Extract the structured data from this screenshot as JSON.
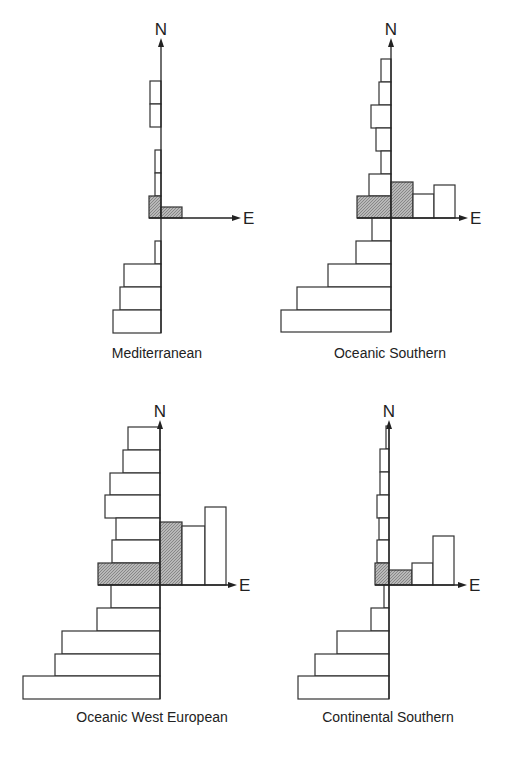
{
  "figure": {
    "axis_labels": {
      "north": "N",
      "east": "E"
    },
    "colors": {
      "line": "#333333",
      "hatch": "#9a9a9a",
      "background": "#ffffff"
    },
    "panels": [
      {
        "id": "mediterranean",
        "caption": "Mediterranean",
        "origin": {
          "x": 161,
          "y": 218
        },
        "n_axis_top": 38,
        "e_axis_right": 232,
        "caption_pos": {
          "x": 157,
          "y": 358
        },
        "west_bars": [
          {
            "y": 81,
            "h": 23,
            "x": 150,
            "hatched": false
          },
          {
            "y": 104,
            "h": 23,
            "x": 150,
            "hatched": false
          },
          {
            "y": 150,
            "h": 23,
            "x": 155,
            "hatched": false
          },
          {
            "y": 173,
            "h": 23,
            "x": 155,
            "hatched": false
          },
          {
            "y": 196,
            "h": 22,
            "x": 149,
            "hatched": true
          },
          {
            "y": 241,
            "h": 23,
            "x": 155,
            "hatched": false
          },
          {
            "y": 264,
            "h": 23,
            "x": 124,
            "hatched": false
          },
          {
            "y": 287,
            "h": 23,
            "x": 120,
            "hatched": false
          },
          {
            "y": 310,
            "h": 23,
            "x": 113,
            "hatched": false
          }
        ],
        "east_bars": [
          {
            "x": 161,
            "w": 21,
            "y": 207,
            "hatched": true
          }
        ]
      },
      {
        "id": "oceanic-southern",
        "caption": "Oceanic Southern",
        "origin": {
          "x": 391,
          "y": 218
        },
        "n_axis_top": 38,
        "e_axis_right": 459,
        "caption_pos": {
          "x": 390,
          "y": 358
        },
        "west_bars": [
          {
            "y": 59,
            "h": 23,
            "x": 381,
            "hatched": false
          },
          {
            "y": 82,
            "h": 23,
            "x": 379,
            "hatched": false
          },
          {
            "y": 105,
            "h": 23,
            "x": 371,
            "hatched": false
          },
          {
            "y": 128,
            "h": 23,
            "x": 376,
            "hatched": false
          },
          {
            "y": 151,
            "h": 23,
            "x": 381,
            "hatched": false
          },
          {
            "y": 174,
            "h": 22,
            "x": 369,
            "hatched": false
          },
          {
            "y": 196,
            "h": 22,
            "x": 357,
            "hatched": true
          },
          {
            "y": 218,
            "h": 23,
            "x": 372,
            "hatched": false
          },
          {
            "y": 241,
            "h": 23,
            "x": 356,
            "hatched": false
          },
          {
            "y": 264,
            "h": 23,
            "x": 328,
            "hatched": false
          },
          {
            "y": 287,
            "h": 23,
            "x": 297,
            "hatched": false
          },
          {
            "y": 310,
            "h": 22,
            "x": 281,
            "hatched": false
          }
        ],
        "east_bars": [
          {
            "x": 391,
            "w": 22,
            "y": 182,
            "hatched": true
          },
          {
            "x": 413,
            "w": 21,
            "y": 194,
            "hatched": false
          },
          {
            "x": 434,
            "w": 21,
            "y": 185,
            "hatched": false
          }
        ]
      },
      {
        "id": "oceanic-west-european",
        "caption": "Oceanic West European",
        "origin": {
          "x": 160,
          "y": 585
        },
        "n_axis_top": 420,
        "e_axis_right": 228,
        "caption_pos": {
          "x": 152,
          "y": 722
        },
        "west_bars": [
          {
            "y": 427,
            "h": 23,
            "x": 128,
            "hatched": false
          },
          {
            "y": 450,
            "h": 23,
            "x": 123,
            "hatched": false
          },
          {
            "y": 473,
            "h": 22,
            "x": 110,
            "hatched": false
          },
          {
            "y": 495,
            "h": 23,
            "x": 105,
            "hatched": false
          },
          {
            "y": 518,
            "h": 22,
            "x": 116,
            "hatched": false
          },
          {
            "y": 540,
            "h": 23,
            "x": 112,
            "hatched": false
          },
          {
            "y": 563,
            "h": 22,
            "x": 98,
            "hatched": true
          },
          {
            "y": 585,
            "h": 23,
            "x": 111,
            "hatched": false
          },
          {
            "y": 608,
            "h": 23,
            "x": 97,
            "hatched": false
          },
          {
            "y": 631,
            "h": 23,
            "x": 62,
            "hatched": false
          },
          {
            "y": 654,
            "h": 22,
            "x": 55,
            "hatched": false
          },
          {
            "y": 676,
            "h": 23,
            "x": 23,
            "hatched": false
          }
        ],
        "east_bars": [
          {
            "x": 160,
            "w": 22,
            "y": 522,
            "hatched": true
          },
          {
            "x": 182,
            "w": 23,
            "y": 526,
            "hatched": false
          },
          {
            "x": 205,
            "w": 21,
            "y": 507,
            "hatched": false
          }
        ]
      },
      {
        "id": "continental-southern",
        "caption": "Continental Southern",
        "origin": {
          "x": 389,
          "y": 585
        },
        "n_axis_top": 420,
        "e_axis_right": 458,
        "caption_pos": {
          "x": 388,
          "y": 722
        },
        "west_bars": [
          {
            "y": 426,
            "h": 23,
            "x": 386,
            "hatched": false
          },
          {
            "y": 449,
            "h": 23,
            "x": 380,
            "hatched": false
          },
          {
            "y": 472,
            "h": 23,
            "x": 380,
            "hatched": false
          },
          {
            "y": 495,
            "h": 23,
            "x": 377,
            "hatched": false
          },
          {
            "y": 518,
            "h": 22,
            "x": 379,
            "hatched": false
          },
          {
            "y": 540,
            "h": 23,
            "x": 377,
            "hatched": false
          },
          {
            "y": 563,
            "h": 22,
            "x": 375,
            "hatched": true
          },
          {
            "y": 585,
            "h": 23,
            "x": 384,
            "hatched": false
          },
          {
            "y": 608,
            "h": 23,
            "x": 371,
            "hatched": false
          },
          {
            "y": 631,
            "h": 23,
            "x": 337,
            "hatched": false
          },
          {
            "y": 654,
            "h": 22,
            "x": 315,
            "hatched": false
          },
          {
            "y": 676,
            "h": 23,
            "x": 298,
            "hatched": false
          }
        ],
        "east_bars": [
          {
            "x": 389,
            "w": 23,
            "y": 570,
            "hatched": true
          },
          {
            "x": 412,
            "w": 21,
            "y": 563,
            "hatched": false
          },
          {
            "x": 433,
            "w": 21,
            "y": 536,
            "hatched": false
          }
        ]
      }
    ]
  }
}
